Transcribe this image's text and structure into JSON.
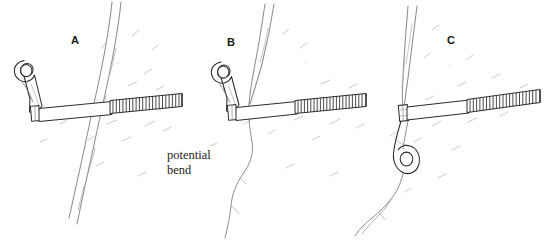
{
  "figure": {
    "medium": "pen-and-ink line drawing",
    "background_color": "#ffffff",
    "ink_color": "#1a1a1a",
    "rock_texture_color": "#b9b9b9",
    "crack_line_color": "#8a8a8a",
    "width": 552,
    "height": 243
  },
  "annotations": {
    "caption_text": "potential\nbend",
    "caption_line_1": "potential",
    "caption_line_2": "bend"
  },
  "panels": [
    {
      "id": "a",
      "label": "A",
      "label_x": 71,
      "label_y": 34,
      "description": "Bolt drilled beside a wide open crack; hanger eye points up-left, threaded shaft runs right and crosses the crack.",
      "crack": {
        "kind": "wide-open-crack",
        "width_px": 9,
        "top_x": 118,
        "bottom_x": 66,
        "style": "double-line-fissure"
      },
      "bolt": {
        "hanger_orientation": "up-left",
        "hanger_eye_x": 26,
        "hanger_eye_y": 71,
        "shaft_start_x": 40,
        "shaft_start_y": 113,
        "shaft_end_x": 182,
        "shaft_end_y": 100,
        "thread_start_x": 110,
        "thread_count": 22
      }
    },
    {
      "id": "b",
      "label": "B",
      "label_x": 227,
      "label_y": 36,
      "description": "Bolt placed next to a thin hairline seam; the shaft crosses the seam where the rock may flex, the potential bend location.",
      "crack": {
        "kind": "thin-seam",
        "width_px": 1,
        "top_x": 268,
        "bottom_x": 228,
        "style": "single-line-seam"
      },
      "bolt": {
        "hanger_orientation": "up-left",
        "hanger_eye_x": 224,
        "hanger_eye_y": 73,
        "shaft_start_x": 232,
        "shaft_start_y": 112,
        "shaft_end_x": 366,
        "shaft_end_y": 99,
        "thread_start_x": 296,
        "thread_count": 22
      }
    },
    {
      "id": "c",
      "label": "C",
      "label_x": 447,
      "label_y": 34,
      "description": "Bolt set right at the crack edge with the hanger rotated so it hangs down below the bolt head.",
      "crack": {
        "kind": "tapering-crack",
        "width_px": 5,
        "top_x": 410,
        "bottom_x": 378,
        "style": "double-line-fissure"
      },
      "bolt": {
        "hanger_orientation": "down",
        "hanger_eye_x": 404,
        "hanger_eye_y": 155,
        "shaft_start_x": 404,
        "shaft_start_y": 112,
        "shaft_end_x": 540,
        "shaft_end_y": 96,
        "thread_start_x": 467,
        "thread_count": 22
      }
    }
  ]
}
